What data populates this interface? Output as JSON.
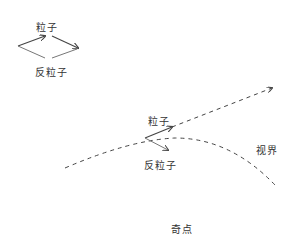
{
  "diagram": {
    "topic": "Hawking radiation at event horizon",
    "pair_inset": {
      "particle_label": "粒子",
      "antiparticle_label": "反粒子"
    },
    "horizon_scene": {
      "particle_label": "粒子",
      "antiparticle_label": "反粒子",
      "horizon_label": "视界",
      "singularity_label": "奇点"
    },
    "colors": {
      "line": "#444444",
      "text": "#333333",
      "background": "#ffffff"
    }
  }
}
